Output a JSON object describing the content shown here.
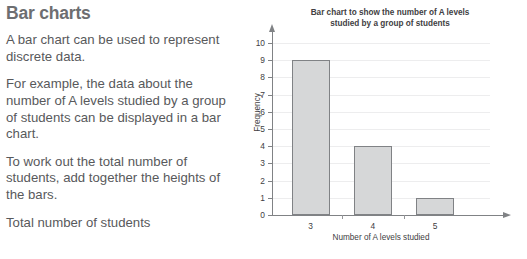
{
  "article": {
    "heading": "Bar charts",
    "paragraphs": [
      "A bar chart can be used to represent discrete data.",
      "For example, the data about the number of A levels studied by a group of students can be displayed in a bar chart.",
      "To work out the total number of students, add together the heights of the bars.",
      "Total number of students"
    ]
  },
  "chart_data": {
    "type": "bar",
    "title": "Bar chart to show the number of A levels studied by a group of students",
    "title_lines": [
      "Bar chart to show the number of A levels",
      "studied by a group of students"
    ],
    "categories": [
      "3",
      "4",
      "5"
    ],
    "values": [
      9,
      4,
      1
    ],
    "xlabel": "Number of A levels studied",
    "ylabel": "Frequency",
    "ylim": [
      0,
      10
    ],
    "ytick_labels": [
      "0",
      "1",
      "2",
      "3",
      "4",
      "5",
      "6",
      "7",
      "8",
      "9",
      "10"
    ],
    "grid": true,
    "legend": "none",
    "bar_fill": "#d6d7d8",
    "bar_stroke": "#808285",
    "axis_color": "#808285",
    "grid_color": "#ededee"
  }
}
